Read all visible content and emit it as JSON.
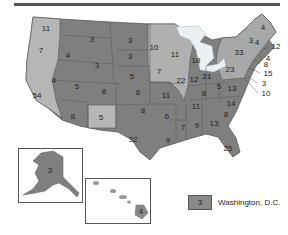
{
  "map": {
    "title": "Electoral votes by state",
    "colors": {
      "dark": "#7a7a7a",
      "mid": "#8e8e8e",
      "light": "#b4b4b4",
      "lake": "#e8eef2",
      "border": "#555555"
    },
    "states": [
      {
        "id": "WA",
        "votes": "11",
        "x": 46,
        "y": 29,
        "shade": "light"
      },
      {
        "id": "OR",
        "votes": "7",
        "x": 41,
        "y": 51,
        "shade": "light"
      },
      {
        "id": "CA",
        "votes": "54",
        "x": 37,
        "y": 96,
        "shade": "light"
      },
      {
        "id": "ID",
        "votes": "4",
        "x": 68,
        "y": 56,
        "shade": "dark"
      },
      {
        "id": "NV",
        "votes": "4",
        "x": 54,
        "y": 81,
        "shade": "dark"
      },
      {
        "id": "MT",
        "votes": "3",
        "x": 92,
        "y": 40,
        "shade": "dark"
      },
      {
        "id": "WY",
        "votes": "3",
        "x": 97,
        "y": 66,
        "shade": "dark"
      },
      {
        "id": "UT",
        "votes": "5",
        "x": 77,
        "y": 87,
        "shade": "dark"
      },
      {
        "id": "CO",
        "votes": "8",
        "x": 104,
        "y": 92,
        "shade": "dark"
      },
      {
        "id": "AZ",
        "votes": "8",
        "x": 73,
        "y": 117,
        "shade": "dark"
      },
      {
        "id": "NM",
        "votes": "5",
        "x": 101,
        "y": 118,
        "shade": "light"
      },
      {
        "id": "ND",
        "votes": "3",
        "x": 130,
        "y": 41,
        "shade": "dark"
      },
      {
        "id": "SD",
        "votes": "3",
        "x": 130,
        "y": 57,
        "shade": "dark"
      },
      {
        "id": "NE",
        "votes": "5",
        "x": 132,
        "y": 77,
        "shade": "dark"
      },
      {
        "id": "KS",
        "votes": "6",
        "x": 138,
        "y": 93,
        "shade": "dark"
      },
      {
        "id": "OK",
        "votes": "8",
        "x": 143,
        "y": 111,
        "shade": "dark"
      },
      {
        "id": "TX",
        "votes": "32",
        "x": 133,
        "y": 140,
        "shade": "dark"
      },
      {
        "id": "MN",
        "votes": "10",
        "x": 154,
        "y": 48,
        "shade": "light"
      },
      {
        "id": "IA",
        "votes": "7",
        "x": 159,
        "y": 72,
        "shade": "light"
      },
      {
        "id": "MO",
        "votes": "11",
        "x": 166,
        "y": 96,
        "shade": "dark"
      },
      {
        "id": "AR",
        "votes": "6",
        "x": 167,
        "y": 117,
        "shade": "dark"
      },
      {
        "id": "LA",
        "votes": "9",
        "x": 168,
        "y": 141,
        "shade": "dark"
      },
      {
        "id": "WI",
        "votes": "11",
        "x": 175,
        "y": 55,
        "shade": "light"
      },
      {
        "id": "IL",
        "votes": "22",
        "x": 181,
        "y": 81,
        "shade": "light"
      },
      {
        "id": "MI",
        "votes": "18",
        "x": 196,
        "y": 61,
        "shade": "light"
      },
      {
        "id": "IN",
        "votes": "12",
        "x": 194,
        "y": 80,
        "shade": "dark"
      },
      {
        "id": "OH",
        "votes": "21",
        "x": 207,
        "y": 77,
        "shade": "dark"
      },
      {
        "id": "KY",
        "votes": "8",
        "x": 204,
        "y": 94,
        "shade": "dark"
      },
      {
        "id": "TN",
        "votes": "11",
        "x": 196,
        "y": 107,
        "shade": "dark"
      },
      {
        "id": "MS",
        "votes": "7",
        "x": 183,
        "y": 128,
        "shade": "dark"
      },
      {
        "id": "AL",
        "votes": "9",
        "x": 197,
        "y": 126,
        "shade": "dark"
      },
      {
        "id": "GA",
        "votes": "13",
        "x": 214,
        "y": 124,
        "shade": "dark"
      },
      {
        "id": "FL",
        "votes": "25",
        "x": 228,
        "y": 149,
        "shade": "dark"
      },
      {
        "id": "SC",
        "votes": "8",
        "x": 226,
        "y": 115,
        "shade": "dark"
      },
      {
        "id": "NC",
        "votes": "14",
        "x": 231,
        "y": 104,
        "shade": "dark"
      },
      {
        "id": "VA",
        "votes": "13",
        "x": 232,
        "y": 89,
        "shade": "dark"
      },
      {
        "id": "WV",
        "votes": "5",
        "x": 219,
        "y": 87,
        "shade": "dark"
      },
      {
        "id": "PA",
        "votes": "23",
        "x": 230,
        "y": 70,
        "shade": "light"
      },
      {
        "id": "NY",
        "votes": "33",
        "x": 239,
        "y": 53,
        "shade": "light"
      },
      {
        "id": "VT",
        "votes": "3",
        "x": 251,
        "y": 41,
        "shade": "dark"
      },
      {
        "id": "NH",
        "votes": "4",
        "x": 257,
        "y": 43,
        "shade": "dark"
      },
      {
        "id": "ME",
        "votes": "4",
        "x": 263,
        "y": 28,
        "shade": "light"
      }
    ],
    "callouts": [
      {
        "id": "MA",
        "votes": "12",
        "x": 272,
        "y": 47
      },
      {
        "id": "RI",
        "votes": "4",
        "x": 264,
        "y": 59
      },
      {
        "id": "CT",
        "votes": "8",
        "x": 262,
        "y": 65
      },
      {
        "id": "NJ",
        "votes": "15",
        "x": 264,
        "y": 74
      },
      {
        "id": "DE",
        "votes": "3",
        "x": 260,
        "y": 84
      },
      {
        "id": "MD",
        "votes": "10",
        "x": 262,
        "y": 94
      }
    ],
    "alaska": {
      "votes": "3"
    },
    "hawaii": {
      "votes": "4"
    },
    "dc": {
      "votes": "3",
      "label": "Washington, D.C."
    }
  }
}
